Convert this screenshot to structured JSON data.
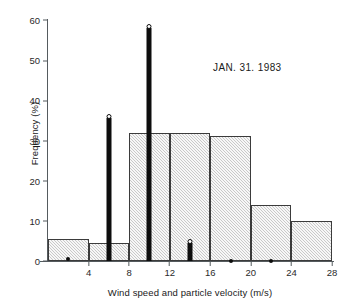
{
  "chart_data": {
    "type": "bar",
    "title": "",
    "annotation": "JAN. 31. 1983",
    "xlabel": "Wind speed and particle velocity (m/s)",
    "ylabel": "Frequency (%)",
    "xlim": [
      0,
      28
    ],
    "ylim": [
      0,
      60
    ],
    "grid": false,
    "legend": "none",
    "xticks": [
      4,
      8,
      12,
      16,
      20,
      24,
      28
    ],
    "xtick_labels": [
      "4",
      "8",
      "12",
      "16",
      "20",
      "24",
      "28"
    ],
    "yticks": [
      0,
      10,
      20,
      30,
      40,
      50,
      60
    ],
    "ytick_labels": [
      "0",
      "10",
      "20",
      "30",
      "40",
      "50",
      "60"
    ],
    "series": [
      {
        "name": "Wind speed",
        "style": "histogram-gray-hatched",
        "bin_width": 4,
        "bins": [
          {
            "x0": 0,
            "x1": 4,
            "value": 5.5
          },
          {
            "x0": 4,
            "x1": 8,
            "value": 4.5
          },
          {
            "x0": 8,
            "x1": 12,
            "value": 31.8
          },
          {
            "x0": 12,
            "x1": 16,
            "value": 31.8
          },
          {
            "x0": 16,
            "x1": 20,
            "value": 31.0
          },
          {
            "x0": 20,
            "x1": 24,
            "value": 14.0
          },
          {
            "x0": 24,
            "x1": 28,
            "value": 10.0
          },
          {
            "x0": 28,
            "x1": 32,
            "value": 4.7
          }
        ]
      },
      {
        "name": "Particle velocity",
        "style": "spike-black-with-marker",
        "points": [
          {
            "x": 2,
            "value": 0.6
          },
          {
            "x": 6,
            "value": 35.5
          },
          {
            "x": 10,
            "value": 58.0
          },
          {
            "x": 14,
            "value": 4.4
          },
          {
            "x": 18,
            "value": 0.0
          },
          {
            "x": 22,
            "value": 0.0
          }
        ]
      }
    ]
  },
  "colors": {
    "bar_fill": "#c9c9c9",
    "bar_edge": "#3b3b3b",
    "spike": "#0d0d0d",
    "axis": "#555b5e",
    "text": "#1a1a1a",
    "background": "#ffffff"
  }
}
